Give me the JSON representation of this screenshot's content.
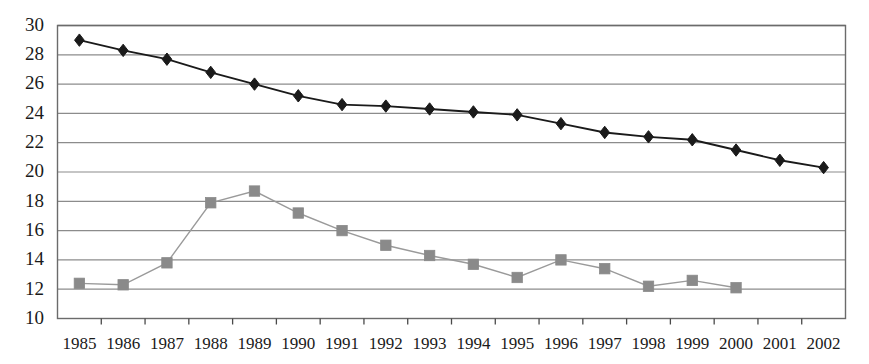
{
  "chart_data": {
    "type": "line",
    "title": "",
    "subtitle": "",
    "xlabel": "",
    "ylabel": "",
    "categories": [
      "1985",
      "1986",
      "1987",
      "1988",
      "1989",
      "1990",
      "1991",
      "1992",
      "1993",
      "1994",
      "1995",
      "1996",
      "1997",
      "1998",
      "1999",
      "2000",
      "2001",
      "2002"
    ],
    "x": [
      1985,
      1986,
      1987,
      1988,
      1989,
      1990,
      1991,
      1992,
      1993,
      1994,
      1995,
      1996,
      1997,
      1998,
      1999,
      2000,
      2001,
      2002
    ],
    "ylim": [
      10,
      30
    ],
    "yticks": [
      10,
      12,
      14,
      16,
      18,
      20,
      22,
      24,
      26,
      28,
      30
    ],
    "ytick_labels": [
      "10",
      "12",
      "14",
      "16",
      "18",
      "20",
      "22",
      "24",
      "26",
      "28",
      "30"
    ],
    "xtick_labels": [
      "1985",
      "1986",
      "1987",
      "1988",
      "1989",
      "1990",
      "1991",
      "1992",
      "1993",
      "1994",
      "1995",
      "1996",
      "1997",
      "1998",
      "1999",
      "2000",
      "2001",
      "2002"
    ],
    "grid": true,
    "grid_axis": "y",
    "legend": "none",
    "series": [
      {
        "name": "series-diamond",
        "marker": "diamond",
        "color": "#1a1a1a",
        "line_color": "#1a1a1a",
        "values": [
          29.0,
          28.3,
          27.7,
          26.8,
          26.0,
          25.2,
          24.6,
          24.5,
          24.3,
          24.1,
          23.9,
          23.3,
          22.7,
          22.4,
          22.2,
          21.5,
          20.8,
          20.3
        ]
      },
      {
        "name": "series-square",
        "marker": "square",
        "color": "#8a8a8a",
        "line_color": "#9a9a9a",
        "values": [
          12.4,
          12.3,
          13.8,
          17.9,
          18.7,
          17.2,
          16.0,
          15.0,
          14.3,
          13.7,
          12.8,
          14.0,
          13.4,
          12.2,
          12.6,
          12.1,
          null,
          null
        ]
      }
    ]
  },
  "axes": {
    "frame_color": "#6b6b6b",
    "gridline_color": "#8c8c8c",
    "tick_color": "#4a4a4a",
    "background": "#ffffff"
  }
}
